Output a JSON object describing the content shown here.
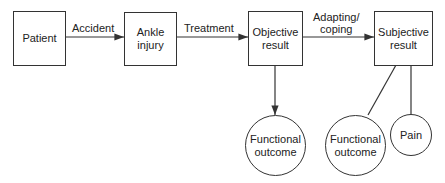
{
  "nodes": {
    "patient": {
      "line1": "Patient"
    },
    "ankle_injury": {
      "line1": "Ankle",
      "line2": "injury"
    },
    "objective_result": {
      "line1": "Objective",
      "line2": "result"
    },
    "subjective_result": {
      "line1": "Subjective",
      "line2": "result"
    },
    "functional_outcome_1": {
      "line1": "Functional",
      "line2": "outcome"
    },
    "functional_outcome_2": {
      "line1": "Functional",
      "line2": "outcome"
    },
    "pain": {
      "line1": "Pain"
    }
  },
  "edges": {
    "accident": {
      "line1": "Accident"
    },
    "treatment": {
      "line1": "Treatment"
    },
    "adapting": {
      "line1": "Adapting/",
      "line2": "coping"
    }
  }
}
